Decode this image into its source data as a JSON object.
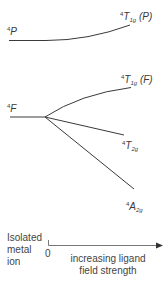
{
  "diagram": {
    "title": "",
    "type": "Tanabe-Sugano-style correlation diagram (d3/d7 octahedral quartet terms)",
    "colors": {
      "line": "#3a3a3a",
      "text": "#3a3a3a",
      "background": "#ffffff"
    },
    "free_ion_terms": [
      {
        "id": "4P",
        "multiplicity": "4",
        "symbol": "P"
      },
      {
        "id": "4F",
        "multiplicity": "4",
        "symbol": "F"
      }
    ],
    "split_terms": [
      {
        "id": "4T1g(P)",
        "multiplicity": "4",
        "symbol": "T",
        "subscript": "1g",
        "parent": "(P)",
        "from": "4P",
        "trend": "rises slowly"
      },
      {
        "id": "4T1g(F)",
        "multiplicity": "4",
        "symbol": "T",
        "subscript": "1g",
        "parent": "(F)",
        "from": "4F",
        "trend": "rises"
      },
      {
        "id": "4T2g",
        "multiplicity": "4",
        "symbol": "T",
        "subscript": "2g",
        "parent": "",
        "from": "4F",
        "trend": "falls"
      },
      {
        "id": "4A2g",
        "multiplicity": "4",
        "symbol": "A",
        "subscript": "2g",
        "parent": "",
        "from": "4F",
        "trend": "falls steeply"
      }
    ],
    "axis": {
      "left_label_lines": [
        "Isolated",
        "metal",
        "ion"
      ],
      "origin_label": "0",
      "caption_lines": [
        "increasing ligand",
        "field strength"
      ]
    }
  }
}
